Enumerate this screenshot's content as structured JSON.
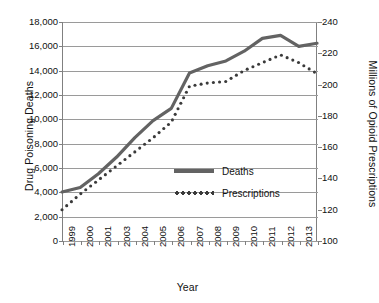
{
  "chart_data": {
    "type": "line",
    "title": "",
    "xlabel": "Year",
    "ylabel": "Drug Poisoning Deaths",
    "ylabel_secondary": "Millions of Opioid Prescriptions",
    "grid": true,
    "legend_position": "inside-lower-right",
    "x": [
      1999,
      2000,
      2001,
      2002,
      2003,
      2004,
      2005,
      2006,
      2007,
      2008,
      2009,
      2010,
      2011,
      2012,
      2013
    ],
    "x_tick_labels": [
      "1999",
      "2000",
      "2001",
      "2003",
      "2004",
      "2005",
      "2006",
      "2007",
      "2008",
      "2009",
      "2010",
      "2011",
      "2012",
      "2013"
    ],
    "ylim": [
      0,
      18000
    ],
    "y_tick_labels": [
      "18,000",
      "16,000",
      "14,000",
      "12,000",
      "10,000",
      "8,000",
      "6,000",
      "4,000",
      "2,000",
      "0"
    ],
    "y_ticks": [
      18000,
      16000,
      14000,
      12000,
      10000,
      8000,
      6000,
      4000,
      2000,
      0
    ],
    "ylim_secondary": [
      100,
      240
    ],
    "y_tick_labels_secondary": [
      "240",
      "220",
      "200",
      "180",
      "160",
      "140",
      "120",
      "100"
    ],
    "y_ticks_secondary": [
      240,
      220,
      200,
      180,
      160,
      140,
      120,
      100
    ],
    "series": [
      {
        "name": "Deaths",
        "axis": "left",
        "style": "solid",
        "color": "#636363",
        "values": [
          4030,
          4400,
          5530,
          6900,
          8500,
          9900,
          10900,
          13800,
          14400,
          14800,
          15600,
          16650,
          16900,
          16000,
          16250
        ]
      },
      {
        "name": "Prescriptions",
        "axis": "right",
        "style": "dotted",
        "color": "#3a3a3a",
        "values": [
          120,
          130,
          139,
          148,
          157,
          166,
          176,
          199,
          201,
          202,
          209,
          214,
          219,
          214,
          207
        ]
      }
    ]
  },
  "legend": {
    "items": [
      {
        "label": "Deaths",
        "key": "solid-line-key"
      },
      {
        "label": "Prescriptions",
        "key": "dotted-line-key"
      }
    ]
  }
}
